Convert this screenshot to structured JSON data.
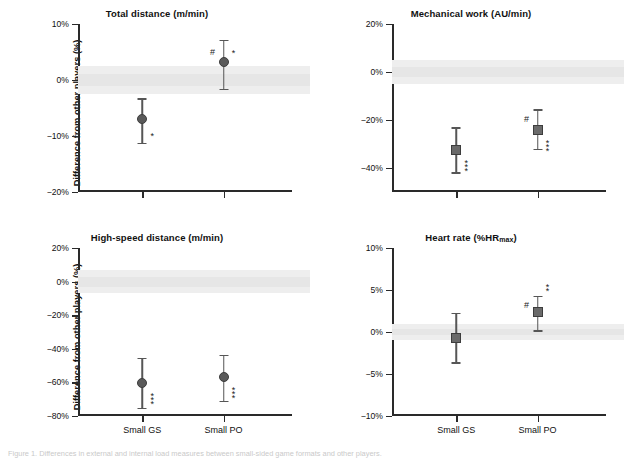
{
  "figure": {
    "ylabel": "Difference from other players (%)",
    "categories": [
      "Small GS",
      "Small PO"
    ],
    "caption": "Figure 1. Differences in external and internal load measures between small-sided game formats and other players."
  },
  "chart_data": [
    {
      "type": "scatter",
      "panel": 1,
      "title": "Total distance (m/min)",
      "xlabel": "",
      "ylabel": "Difference from other players (%)",
      "ylim": [
        -20,
        10
      ],
      "yticks": [
        10,
        0,
        -10,
        -20
      ],
      "ytick_labels": [
        "10%",
        "0%",
        "-10%",
        "-20%"
      ],
      "categories": [
        "Small GS",
        "Small PO"
      ],
      "marker": "circle",
      "reference_band": [
        -2.5,
        2.5
      ],
      "points": [
        {
          "category": "Small GS",
          "value": -7.0,
          "ci_low": -11.2,
          "ci_high": -3.3,
          "hash": "",
          "stars": "*"
        },
        {
          "category": "Small PO",
          "value": 3.2,
          "ci_low": -1.6,
          "ci_high": 7.2,
          "hash": "#",
          "stars": "*"
        }
      ],
      "grid": false,
      "legend": "none"
    },
    {
      "type": "scatter",
      "panel": 2,
      "title": "Mechanical work (AU/min)",
      "xlabel": "",
      "ylabel": "",
      "ylim": [
        -50,
        20
      ],
      "yticks": [
        20,
        0,
        -20,
        -40
      ],
      "ytick_labels": [
        "20%",
        "0%",
        "-20%",
        "-40%"
      ],
      "categories": [
        "Small GS",
        "Small PO"
      ],
      "marker": "square",
      "reference_band": [
        -5,
        5
      ],
      "points": [
        {
          "category": "Small GS",
          "value": -32.5,
          "ci_low": -41.8,
          "ci_high": -23.0,
          "hash": "",
          "stars": "***"
        },
        {
          "category": "Small PO",
          "value": -24.0,
          "ci_low": -32.0,
          "ci_high": -15.5,
          "hash": "#",
          "stars": "***"
        }
      ],
      "grid": false,
      "legend": "none"
    },
    {
      "type": "scatter",
      "panel": 3,
      "title": "High-speed distance (m/min)",
      "xlabel": "",
      "ylabel": "Difference from other players (%)",
      "ylim": [
        -80,
        20
      ],
      "yticks": [
        20,
        0,
        -20,
        -40,
        -60,
        -80
      ],
      "ytick_labels": [
        "20%",
        "0%",
        "-20%",
        "-40%",
        "-60%",
        "-80%"
      ],
      "categories": [
        "Small GS",
        "Small PO"
      ],
      "marker": "circle",
      "reference_band": [
        -7,
        7
      ],
      "points": [
        {
          "category": "Small GS",
          "value": -60.5,
          "ci_low": -75.0,
          "ci_high": -45.5,
          "hash": "",
          "stars": "***"
        },
        {
          "category": "Small PO",
          "value": -56.8,
          "ci_low": -71.0,
          "ci_high": -43.5,
          "hash": "",
          "stars": "***"
        }
      ],
      "grid": false,
      "legend": "none"
    },
    {
      "type": "scatter",
      "panel": 4,
      "title": "Heart rate (%HRmax)",
      "title_main": "Heart rate (%HR",
      "title_sub": "max",
      "title_tail": ")",
      "xlabel": "",
      "ylabel": "",
      "ylim": [
        -10,
        10
      ],
      "yticks": [
        10,
        5,
        0,
        -5,
        -10
      ],
      "ytick_labels": [
        "10%",
        "5%",
        "0%",
        "-5%",
        "-10%"
      ],
      "categories": [
        "Small GS",
        "Small PO"
      ],
      "marker": "square",
      "reference_band": [
        -0.9,
        0.9
      ],
      "points": [
        {
          "category": "Small GS",
          "value": -0.7,
          "ci_low": -3.6,
          "ci_high": 2.3,
          "hash": "",
          "stars": ""
        },
        {
          "category": "Small PO",
          "value": 2.4,
          "ci_low": 0.2,
          "ci_high": 4.3,
          "hash": "#",
          "stars": "**"
        }
      ],
      "grid": false,
      "legend": "none"
    }
  ]
}
